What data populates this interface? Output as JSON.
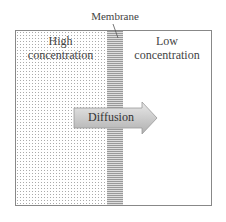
{
  "diagram": {
    "membrane_label": "Membrane",
    "left_region": {
      "label": "High concentration",
      "line1": "High",
      "line2": "concentration"
    },
    "right_region": {
      "label": "Low concentration",
      "line1": "Low",
      "line2": "concentration"
    },
    "arrow": {
      "label": "Diffusion",
      "direction": "right"
    },
    "colors": {
      "border": "#888888",
      "membrane": "#999999",
      "arrow_fill": "#c8c8c8"
    }
  }
}
